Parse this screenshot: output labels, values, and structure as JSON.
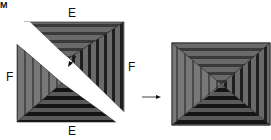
{
  "figure": {
    "corner_label": "M",
    "labels": {
      "top_edge": "E",
      "bottom_edge": "E",
      "left_edge": "F",
      "right_edge": "F"
    },
    "arrow": "right-arrow",
    "colors": {
      "stripe_dark": "#1a1a1a",
      "stripe_mid": "#555555",
      "stripe_light": "#7a7a7a",
      "background": "#ffffff"
    },
    "parts": [
      "upper-right-triangle",
      "lower-left-triangle",
      "assembled-square"
    ]
  }
}
